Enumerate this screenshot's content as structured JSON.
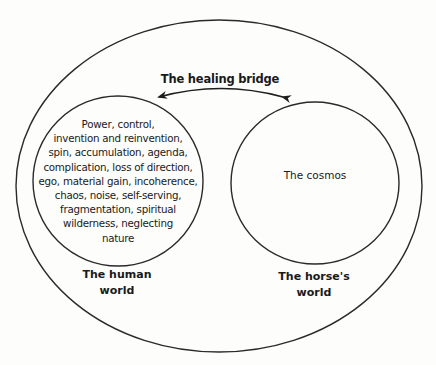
{
  "diagram": {
    "bridge": {
      "label": "The healing bridge",
      "arrow": "bidirectional"
    },
    "human_world": {
      "label_line1": "The human",
      "label_line2": "world",
      "content_lines": [
        "Power, control,",
        "invention and reinvention,",
        "spin, accumulation, agenda,",
        "complication, loss of direction,",
        "ego, material gain, incoherence,",
        "chaos, noise, self-serving,",
        "fragmentation, spiritual",
        "wilderness, neglecting",
        "nature"
      ]
    },
    "horse_world": {
      "label_line1": "The horse's",
      "label_line2": "world",
      "content": "The cosmos"
    },
    "colors": {
      "stroke": "#2a2a2a",
      "text": "#1a1a1a",
      "background": "#fdfdfc"
    }
  }
}
